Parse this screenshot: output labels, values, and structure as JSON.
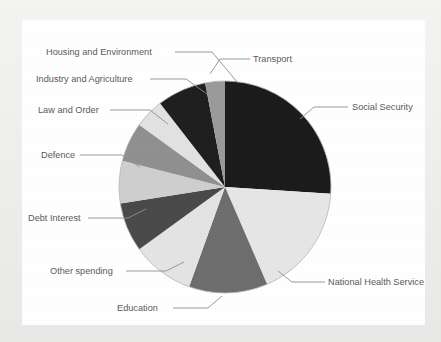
{
  "figure": {
    "background_color": "#f0f0ee",
    "panel_color": "#ffffff",
    "label_color": "#5a5a5a",
    "leader_color": "#8e8e8e",
    "outline_color": "#b8b8b8"
  },
  "chart_data": {
    "type": "pie",
    "title": "",
    "subtitle": "",
    "xlabel": "",
    "ylabel": "",
    "legend_position": "none",
    "grid": false,
    "label_style": "leader-lines",
    "start_angle_deg": 0,
    "direction": "clockwise",
    "center": {
      "x": 225,
      "y": 187
    },
    "radius": 106,
    "categories": [
      "Social Security",
      "National Health Service",
      "Education",
      "Other spending",
      "Debt Interest",
      "Defence",
      "Law and Order",
      "Industry and Agriculture",
      "Housing and Environment",
      "Transport"
    ],
    "values": [
      26.0,
      17.5,
      12.0,
      9.5,
      7.5,
      6.5,
      6.0,
      4.5,
      7.5,
      3.0
    ],
    "units": "percent",
    "colors": [
      "#1c1c1c",
      "#e6e6e6",
      "#6e6e6e",
      "#e4e4e4",
      "#4a4a4a",
      "#cfcfcf",
      "#909090",
      "#e2e2e2",
      "#1f1f1f",
      "#9a9a9a"
    ],
    "slices": [
      {
        "label": "Social Security",
        "value": 26.0,
        "start_deg": 0.0,
        "end_deg": 93.6,
        "color": "#1c1c1c"
      },
      {
        "label": "National Health Service",
        "value": 17.5,
        "start_deg": 93.6,
        "end_deg": 156.6,
        "color": "#e6e6e6"
      },
      {
        "label": "Education",
        "value": 12.0,
        "start_deg": 156.6,
        "end_deg": 199.8,
        "color": "#6e6e6e"
      },
      {
        "label": "Other spending",
        "value": 9.5,
        "start_deg": 199.8,
        "end_deg": 234.0,
        "color": "#e4e4e4"
      },
      {
        "label": "Debt Interest",
        "value": 7.5,
        "start_deg": 234.0,
        "end_deg": 261.0,
        "color": "#4a4a4a"
      },
      {
        "label": "Defence",
        "value": 6.5,
        "start_deg": 261.0,
        "end_deg": 284.4,
        "color": "#cfcfcf"
      },
      {
        "label": "Law and Order",
        "value": 6.0,
        "start_deg": 284.4,
        "end_deg": 306.0,
        "color": "#909090"
      },
      {
        "label": "Industry and Agriculture",
        "value": 4.5,
        "start_deg": 306.0,
        "end_deg": 322.2,
        "color": "#e2e2e2"
      },
      {
        "label": "Housing and Environment",
        "value": 7.5,
        "start_deg": 322.2,
        "end_deg": 349.2,
        "color": "#1f1f1f"
      },
      {
        "label": "Transport",
        "value": 3.0,
        "start_deg": 349.2,
        "end_deg": 360.0,
        "color": "#9a9a9a"
      }
    ]
  },
  "labels": {
    "housing_and_environment": "Housing and Environment",
    "industry_and_agriculture": "Industry and Agriculture",
    "law_and_order": "Law and Order",
    "defence": "Defence",
    "debt_interest": "Debt Interest",
    "other_spending": "Other spending",
    "education": "Education",
    "national_health_service": "National Health Service",
    "social_security": "Social Security",
    "transport": "Transport"
  }
}
